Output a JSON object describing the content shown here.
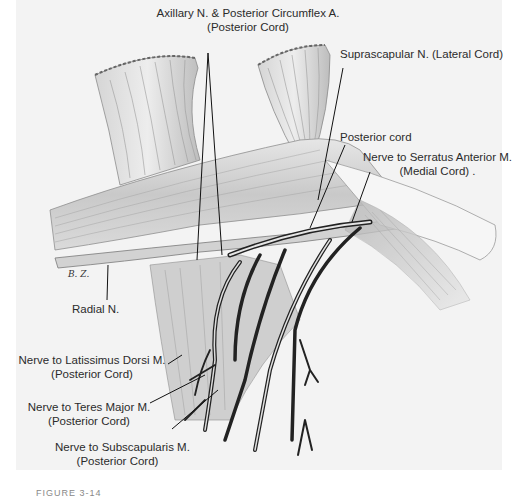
{
  "figure": {
    "signature": "B. Z.",
    "caption": "FIGURE 3-14",
    "background_color": "#f3f3f3",
    "labels": {
      "axillary": {
        "line1": "Axillary N. & Posterior Circumflex A.",
        "line2": "(Posterior Cord)"
      },
      "suprascapular": {
        "line1": "Suprascapular N. (Lateral Cord)"
      },
      "posterior_cord": {
        "line1": "Posterior cord"
      },
      "serratus": {
        "line1": "Nerve to Serratus Anterior M.",
        "line2": "(Medial Cord) ."
      },
      "radial": {
        "line1": "Radial N."
      },
      "latissimus": {
        "line1": "Nerve to Latissimus Dorsi M.",
        "line2": "(Posterior Cord)"
      },
      "teres": {
        "line1": "Nerve to Teres Major M.",
        "line2": "(Posterior Cord)"
      },
      "subscapularis": {
        "line1": "Nerve to Subscapularis M.",
        "line2": "(Posterior Cord)"
      }
    }
  }
}
